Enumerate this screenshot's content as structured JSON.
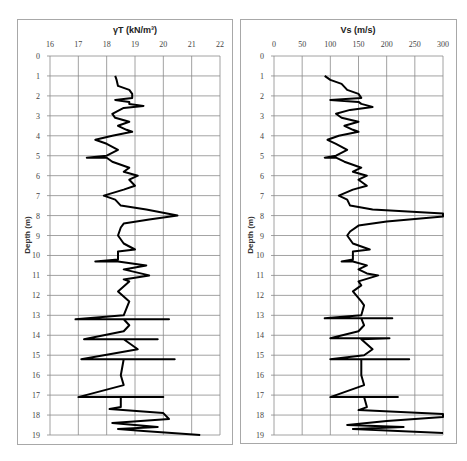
{
  "chart_data": [
    {
      "type": "line",
      "title": "γT (kN/m³)",
      "xlabel": "γT (kN/m³)",
      "ylabel": "Depth (m)",
      "xlim": [
        16,
        22
      ],
      "ylim": [
        19,
        0
      ],
      "x_ticks": [
        "16",
        "17",
        "18",
        "19",
        "20",
        "21",
        "22"
      ],
      "y_ticks": [
        "0",
        "1",
        "2",
        "3",
        "4",
        "5",
        "6",
        "7",
        "8",
        "9",
        "10",
        "11",
        "12",
        "13",
        "14",
        "15",
        "16",
        "17",
        "18",
        "19"
      ],
      "x_axis_position": "top",
      "y_inverted": true,
      "grid": true,
      "legend": "none",
      "series": [
        {
          "name": "γT",
          "color": "#000000",
          "points": [
            [
              18.3,
              1.0
            ],
            [
              18.35,
              1.2
            ],
            [
              18.4,
              1.5
            ],
            [
              18.8,
              1.7
            ],
            [
              18.9,
              1.9
            ],
            [
              18.9,
              2.1
            ],
            [
              18.3,
              2.2
            ],
            [
              18.8,
              2.3
            ],
            [
              18.8,
              2.4
            ],
            [
              19.3,
              2.5
            ],
            [
              18.6,
              2.6
            ],
            [
              18.2,
              2.9
            ],
            [
              18.3,
              3.1
            ],
            [
              18.8,
              3.3
            ],
            [
              18.4,
              3.5
            ],
            [
              18.7,
              3.7
            ],
            [
              18.9,
              3.8
            ],
            [
              18.2,
              4.0
            ],
            [
              17.6,
              4.2
            ],
            [
              18.0,
              4.4
            ],
            [
              18.4,
              4.7
            ],
            [
              18.0,
              5.0
            ],
            [
              17.3,
              5.1
            ],
            [
              18.0,
              5.1
            ],
            [
              18.2,
              5.3
            ],
            [
              18.8,
              5.6
            ],
            [
              18.6,
              5.8
            ],
            [
              19.1,
              6.0
            ],
            [
              18.8,
              6.2
            ],
            [
              19.0,
              6.5
            ],
            [
              18.6,
              6.7
            ],
            [
              17.9,
              7.0
            ],
            [
              18.3,
              7.2
            ],
            [
              18.5,
              7.5
            ],
            [
              19.4,
              7.7
            ],
            [
              20.5,
              8.0
            ],
            [
              19.5,
              8.2
            ],
            [
              18.6,
              8.4
            ],
            [
              18.5,
              8.6
            ],
            [
              18.4,
              9.0
            ],
            [
              18.6,
              9.4
            ],
            [
              19.0,
              9.7
            ],
            [
              18.4,
              9.8
            ],
            [
              18.4,
              10.2
            ],
            [
              17.6,
              10.3
            ],
            [
              18.4,
              10.3
            ],
            [
              19.4,
              10.5
            ],
            [
              18.6,
              10.7
            ],
            [
              19.5,
              11.0
            ],
            [
              18.6,
              11.2
            ],
            [
              18.8,
              11.3
            ],
            [
              18.4,
              11.8
            ],
            [
              18.8,
              12.3
            ],
            [
              18.6,
              13.0
            ],
            [
              16.9,
              13.2
            ],
            [
              20.2,
              13.2
            ],
            [
              18.6,
              13.2
            ],
            [
              18.8,
              13.5
            ],
            [
              18.6,
              13.8
            ],
            [
              17.2,
              14.2
            ],
            [
              19.8,
              14.2
            ],
            [
              18.6,
              14.2
            ],
            [
              19.1,
              14.7
            ],
            [
              17.1,
              15.2
            ],
            [
              20.4,
              15.2
            ],
            [
              18.6,
              15.2
            ],
            [
              18.5,
              16.0
            ],
            [
              18.6,
              16.5
            ],
            [
              17.0,
              17.1
            ],
            [
              20.0,
              17.1
            ],
            [
              18.5,
              17.1
            ],
            [
              18.5,
              17.6
            ],
            [
              18.1,
              17.7
            ],
            [
              20.0,
              17.9
            ],
            [
              20.2,
              18.2
            ],
            [
              18.2,
              18.4
            ],
            [
              19.8,
              18.6
            ],
            [
              18.4,
              18.7
            ],
            [
              19.3,
              18.8
            ],
            [
              21.3,
              19.0
            ]
          ]
        }
      ]
    },
    {
      "type": "line",
      "title": "Vs (m/s)",
      "xlabel": "Vs (m/s)",
      "ylabel": "Depth (m)",
      "xlim": [
        0,
        300
      ],
      "ylim": [
        19,
        0
      ],
      "x_ticks": [
        "0",
        "50",
        "100",
        "150",
        "200",
        "250",
        "300"
      ],
      "y_ticks": [
        "0",
        "1",
        "2",
        "3",
        "4",
        "5",
        "6",
        "7",
        "8",
        "9",
        "10",
        "11",
        "12",
        "13",
        "14",
        "15",
        "16",
        "17",
        "18",
        "19"
      ],
      "x_axis_position": "top",
      "y_inverted": true,
      "grid": true,
      "legend": "none",
      "series": [
        {
          "name": "Vs",
          "color": "#000000",
          "points": [
            [
              90,
              1.0
            ],
            [
              100,
              1.2
            ],
            [
              120,
              1.4
            ],
            [
              130,
              1.7
            ],
            [
              150,
              1.9
            ],
            [
              155,
              2.1
            ],
            [
              100,
              2.2
            ],
            [
              150,
              2.3
            ],
            [
              155,
              2.4
            ],
            [
              175,
              2.55
            ],
            [
              135,
              2.7
            ],
            [
              110,
              2.9
            ],
            [
              120,
              3.1
            ],
            [
              150,
              3.3
            ],
            [
              125,
              3.5
            ],
            [
              140,
              3.7
            ],
            [
              150,
              3.8
            ],
            [
              115,
              4.0
            ],
            [
              95,
              4.2
            ],
            [
              110,
              4.4
            ],
            [
              130,
              4.7
            ],
            [
              110,
              5.0
            ],
            [
              90,
              5.1
            ],
            [
              110,
              5.1
            ],
            [
              125,
              5.3
            ],
            [
              155,
              5.6
            ],
            [
              140,
              5.8
            ],
            [
              165,
              6.0
            ],
            [
              150,
              6.2
            ],
            [
              165,
              6.5
            ],
            [
              140,
              6.7
            ],
            [
              115,
              7.0
            ],
            [
              130,
              7.2
            ],
            [
              135,
              7.5
            ],
            [
              175,
              7.7
            ],
            [
              300,
              7.9
            ],
            [
              300,
              8.05
            ],
            [
              200,
              8.3
            ],
            [
              150,
              8.5
            ],
            [
              135,
              8.8
            ],
            [
              130,
              9.0
            ],
            [
              140,
              9.4
            ],
            [
              170,
              9.7
            ],
            [
              140,
              9.8
            ],
            [
              140,
              10.2
            ],
            [
              120,
              10.3
            ],
            [
              140,
              10.3
            ],
            [
              165,
              10.5
            ],
            [
              150,
              10.7
            ],
            [
              165,
              10.9
            ],
            [
              185,
              11.0
            ],
            [
              150,
              11.3
            ],
            [
              155,
              11.5
            ],
            [
              140,
              11.8
            ],
            [
              155,
              12.3
            ],
            [
              160,
              12.5
            ],
            [
              155,
              13.0
            ],
            [
              90,
              13.15
            ],
            [
              210,
              13.15
            ],
            [
              155,
              13.15
            ],
            [
              160,
              13.5
            ],
            [
              150,
              13.8
            ],
            [
              100,
              14.15
            ],
            [
              205,
              14.15
            ],
            [
              155,
              14.2
            ],
            [
              175,
              14.7
            ],
            [
              160,
              15.0
            ],
            [
              100,
              15.2
            ],
            [
              240,
              15.2
            ],
            [
              155,
              15.2
            ],
            [
              155,
              16.0
            ],
            [
              160,
              16.5
            ],
            [
              100,
              17.1
            ],
            [
              220,
              17.1
            ],
            [
              160,
              17.1
            ],
            [
              165,
              17.6
            ],
            [
              150,
              17.75
            ],
            [
              300,
              17.95
            ],
            [
              300,
              18.1
            ],
            [
              200,
              18.3
            ],
            [
              130,
              18.5
            ],
            [
              230,
              18.6
            ],
            [
              140,
              18.7
            ],
            [
              300,
              18.9
            ]
          ]
        }
      ]
    }
  ],
  "panels": {
    "left": {
      "title": "γT (kN/m³)",
      "ylabel": "Depth (m)"
    },
    "right": {
      "title": "Vs (m/s)",
      "ylabel": "Depth (m)"
    }
  }
}
